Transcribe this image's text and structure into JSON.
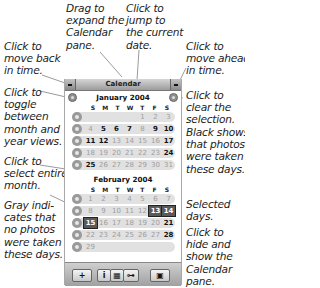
{
  "callouts": {
    "drag": "Drag to\nexpand the\nCalendar\npane.",
    "jump": "Click to\njump to\nthe current\ndate.",
    "back": "Click to\nmove back\nin time.",
    "ahead": "Click to\nmove ahead\nin time.",
    "toggle": "Click to\ntoggle\nbetween\nmonth and\nyear views.",
    "clear": "Click to\nclear the\nselection.",
    "black": "Black shows\nthat photos\nwere taken\nthese days.",
    "entire": "Click to\nselect entire\nmonth.",
    "gray": "Gray indi-\ncates that\nno photos\nwere taken\nthese days.",
    "selected": "Selected\ndays.",
    "hide": "Click to\nhide and\nshow the\nCalendar\npane."
  },
  "panel": {
    "title": "Calendar",
    "weekdays": [
      "S",
      "M",
      "T",
      "W",
      "T",
      "F",
      "S"
    ],
    "months": [
      {
        "title": "January 2004",
        "weeks": [
          [
            {
              "d": ""
            },
            {
              "d": ""
            },
            {
              "d": ""
            },
            {
              "d": ""
            },
            {
              "d": "1"
            },
            {
              "d": "2"
            },
            {
              "d": "3"
            }
          ],
          [
            {
              "d": "4"
            },
            {
              "d": "5",
              "b": 1
            },
            {
              "d": "6",
              "b": 1
            },
            {
              "d": "7",
              "b": 1
            },
            {
              "d": "8"
            },
            {
              "d": "9",
              "b": 1
            },
            {
              "d": "10",
              "b": 1
            }
          ],
          [
            {
              "d": "11",
              "b": 1
            },
            {
              "d": "12",
              "b": 1
            },
            {
              "d": "13"
            },
            {
              "d": "14"
            },
            {
              "d": "15"
            },
            {
              "d": "16"
            },
            {
              "d": "17",
              "b": 1
            }
          ],
          [
            {
              "d": "18"
            },
            {
              "d": "19"
            },
            {
              "d": "20"
            },
            {
              "d": "21"
            },
            {
              "d": "22"
            },
            {
              "d": "23"
            },
            {
              "d": "24",
              "b": 1
            }
          ],
          [
            {
              "d": "25",
              "b": 1
            },
            {
              "d": "26"
            },
            {
              "d": "27"
            },
            {
              "d": "28"
            },
            {
              "d": "29"
            },
            {
              "d": "30"
            },
            {
              "d": "31"
            }
          ]
        ]
      },
      {
        "title": "February 2004",
        "weeks": [
          [
            {
              "d": "1"
            },
            {
              "d": "2"
            },
            {
              "d": "3"
            },
            {
              "d": "4"
            },
            {
              "d": "5"
            },
            {
              "d": "6"
            },
            {
              "d": "7"
            }
          ],
          [
            {
              "d": "8"
            },
            {
              "d": "9"
            },
            {
              "d": "10"
            },
            {
              "d": "11"
            },
            {
              "d": "12"
            },
            {
              "d": "13",
              "s": 1
            },
            {
              "d": "14",
              "s": 1
            }
          ],
          [
            {
              "d": "15",
              "s": 1
            },
            {
              "d": "16"
            },
            {
              "d": "17"
            },
            {
              "d": "18"
            },
            {
              "d": "19"
            },
            {
              "d": "20"
            },
            {
              "d": "21",
              "b": 1
            }
          ],
          [
            {
              "d": "22"
            },
            {
              "d": "23"
            },
            {
              "d": "24"
            },
            {
              "d": "25"
            },
            {
              "d": "26"
            },
            {
              "d": "27"
            },
            {
              "d": "28",
              "b": 1
            }
          ],
          [
            {
              "d": "29"
            },
            {
              "d": ""
            },
            {
              "d": ""
            },
            {
              "d": ""
            },
            {
              "d": ""
            },
            {
              "d": ""
            },
            {
              "d": ""
            }
          ]
        ]
      }
    ],
    "toolbar": {
      "add": "+",
      "info": "i",
      "calendar": "▦",
      "keyword": "⊶",
      "fullscreen": "▣"
    }
  }
}
